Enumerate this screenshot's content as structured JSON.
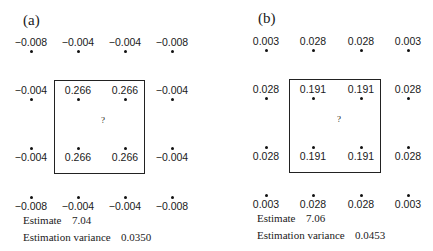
{
  "panels": [
    {
      "label": "(a)",
      "weights": [
        [
          "−0.008",
          "−0.004",
          "−0.004",
          "−0.008"
        ],
        [
          "−0.004",
          "0.266",
          "0.266",
          "−0.004"
        ],
        [
          "−0.004",
          "0.266",
          "0.266",
          "−0.004"
        ],
        [
          "−0.008",
          "−0.004",
          "−0.004",
          "−0.008"
        ]
      ],
      "target_symbol": "?",
      "estimate_label": "Estimate",
      "estimate_value": "7.04",
      "variance_label": "Estimation variance",
      "variance_value": "0.0350"
    },
    {
      "label": "(b)",
      "weights": [
        [
          "0.003",
          "0.028",
          "0.028",
          "0.003"
        ],
        [
          "0.028",
          "0.191",
          "0.191",
          "0.028"
        ],
        [
          "0.028",
          "0.191",
          "0.191",
          "0.028"
        ],
        [
          "0.003",
          "0.028",
          "0.028",
          "0.003"
        ]
      ],
      "target_symbol": "?",
      "estimate_label": "Estimate",
      "estimate_value": "7.06",
      "variance_label": "Estimation variance",
      "variance_value": "0.0453"
    }
  ]
}
